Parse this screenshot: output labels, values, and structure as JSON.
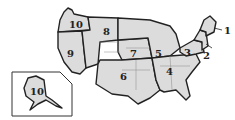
{
  "map": {
    "title": "US regions map",
    "fill_color": "#dcdcdc",
    "border_color": "#222222",
    "regions": [
      {
        "id": "1",
        "label": "1"
      },
      {
        "id": "2",
        "label": "2"
      },
      {
        "id": "3",
        "label": "3"
      },
      {
        "id": "4",
        "label": "4"
      },
      {
        "id": "5",
        "label": "5"
      },
      {
        "id": "6",
        "label": "6"
      },
      {
        "id": "7",
        "label": "7"
      },
      {
        "id": "8",
        "label": "8"
      },
      {
        "id": "9",
        "label": "9"
      },
      {
        "id": "10",
        "label": "10"
      }
    ],
    "inset": {
      "name": "Alaska inset",
      "label": "10"
    }
  }
}
